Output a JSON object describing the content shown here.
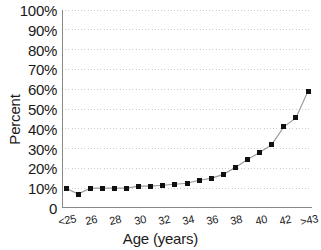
{
  "chart_data": {
    "type": "line",
    "title": "",
    "xlabel": "Age (years)",
    "ylabel": "Percent",
    "categories": [
      "<25",
      "25",
      "26",
      "27",
      "28",
      "29",
      "30",
      "31",
      "32",
      "33",
      "34",
      "35",
      "36",
      "37",
      "38",
      "39",
      "40",
      "41",
      "42",
      "43",
      ">43"
    ],
    "values": [
      10,
      7,
      10,
      10,
      10,
      10,
      11,
      11,
      11.5,
      12,
      12.5,
      14,
      15,
      17,
      20.5,
      24.5,
      28,
      32,
      41,
      45.5,
      59
    ],
    "ylim": [
      0,
      100
    ],
    "ytick_labels": [
      "100%",
      "90%",
      "80%",
      "70%",
      "60%",
      "50%",
      "40%",
      "30%",
      "20%",
      "10%",
      "0"
    ],
    "ytick_values": [
      100,
      90,
      80,
      70,
      60,
      50,
      40,
      30,
      20,
      10,
      0
    ],
    "xtick_labels": [
      "<25",
      "26",
      "28",
      "30",
      "32",
      "34",
      "36",
      "38",
      "40",
      "42",
      ">43"
    ],
    "xtick_indices": [
      0,
      2,
      4,
      6,
      8,
      10,
      12,
      14,
      16,
      18,
      20
    ],
    "grid": "horizontal-dotted",
    "legend": "none",
    "marker": "square",
    "marker_color": "#111111",
    "line_color": "#9a9a9a",
    "grid_color": "#c8c8d8",
    "axis_color": "#888888",
    "text_color": "#1a1a1a"
  }
}
